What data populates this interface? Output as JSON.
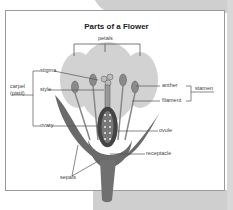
{
  "title": "Parts of a Flower",
  "labels": {
    "petals": "petals",
    "stigma": "stigma",
    "style": "style",
    "ovary": "ovary",
    "carpel": "carpel",
    "pistil": "(pistil)",
    "anther": "anther",
    "filament": "filament",
    "stamen": "stamen",
    "ovule": "ovule",
    "receptacle": "receptacle",
    "sepals": "sepals"
  },
  "colors": {
    "petal": "#cfcfcf",
    "sepal": "#6e6e6e",
    "line": "#555555",
    "background_panel": "#cfcfcf"
  }
}
